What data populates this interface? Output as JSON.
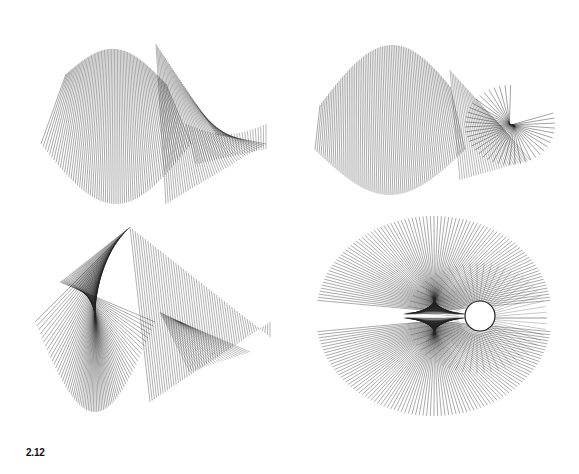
{
  "figure": {
    "caption": "2.12",
    "panels": [
      {
        "id": "top-left",
        "description": "ruled surface wireframe, peaked fan with fold",
        "x": 36,
        "y": 24,
        "w": 240,
        "h": 190
      },
      {
        "id": "top-right",
        "description": "ruled surface wireframe, ridge with radiating fan",
        "x": 310,
        "y": 40,
        "w": 245,
        "h": 160
      },
      {
        "id": "bottom-left",
        "description": "ruled surface wireframe, cone peak with trailing fold",
        "x": 30,
        "y": 222,
        "w": 245,
        "h": 205
      },
      {
        "id": "bottom-right",
        "description": "ruled surface wireframe, double-lobed fan with loop",
        "x": 312,
        "y": 208,
        "w": 245,
        "h": 215
      }
    ],
    "stroke_color": "#222222"
  }
}
